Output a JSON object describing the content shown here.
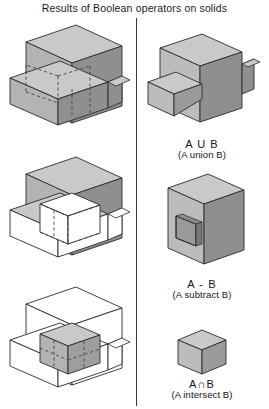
{
  "title": "Results of Boolean operators on solids",
  "layout": {
    "width": 269,
    "height": 409,
    "divider_x": 136,
    "columns": [
      "operands",
      "results"
    ]
  },
  "colors": {
    "background": "#ffffff",
    "text": "#141414",
    "divider": "#3a3a3a",
    "outline": "#2b2b2b",
    "face_top": "#c9c9c9",
    "face_left": "#b3b3b3",
    "face_right": "#8f8f8f",
    "face_white": "#ffffff",
    "face_hole": "#9a9a9a",
    "hidden_edge": "#4a4a4a",
    "highlight": "#ffffff"
  },
  "left_column": {
    "label": "operand-solids",
    "figures": [
      {
        "name": "two-intersecting-boxes-shaded",
        "description": "Solid A and solid B shown as two shaded interpenetrating rectangular boxes in isometric view with hidden intersection edges dashed",
        "shading": "solid-gray",
        "hidden_edges": "dashed"
      },
      {
        "name": "two-intersecting-boxes-intersection-highlighted",
        "description": "Same two boxes with the common intersection volume shown white/highlighted",
        "shading": "solid-gray",
        "hidden_edges": "dashed"
      },
      {
        "name": "two-intersecting-boxes-wireframe",
        "description": "Same two boxes drawn as white wireframe with only the intersection cube shaded gray",
        "shading": "wireframe",
        "hidden_edges": "dashed"
      }
    ]
  },
  "right_column": {
    "label": "boolean-results",
    "results": [
      {
        "name": "union-result",
        "symbol": "A U B",
        "caption": "(A union B)",
        "description": "T-shaped solid combining both boxes"
      },
      {
        "name": "subtract-result",
        "symbol": "A - B",
        "caption": "(A subtract B)",
        "description": "Slab of A with a rectangular hole where B was removed"
      },
      {
        "name": "intersect-result",
        "symbol": "A∩B",
        "caption": "(A intersect B)",
        "description": "Small cube that is the common volume of A and B"
      }
    ]
  }
}
